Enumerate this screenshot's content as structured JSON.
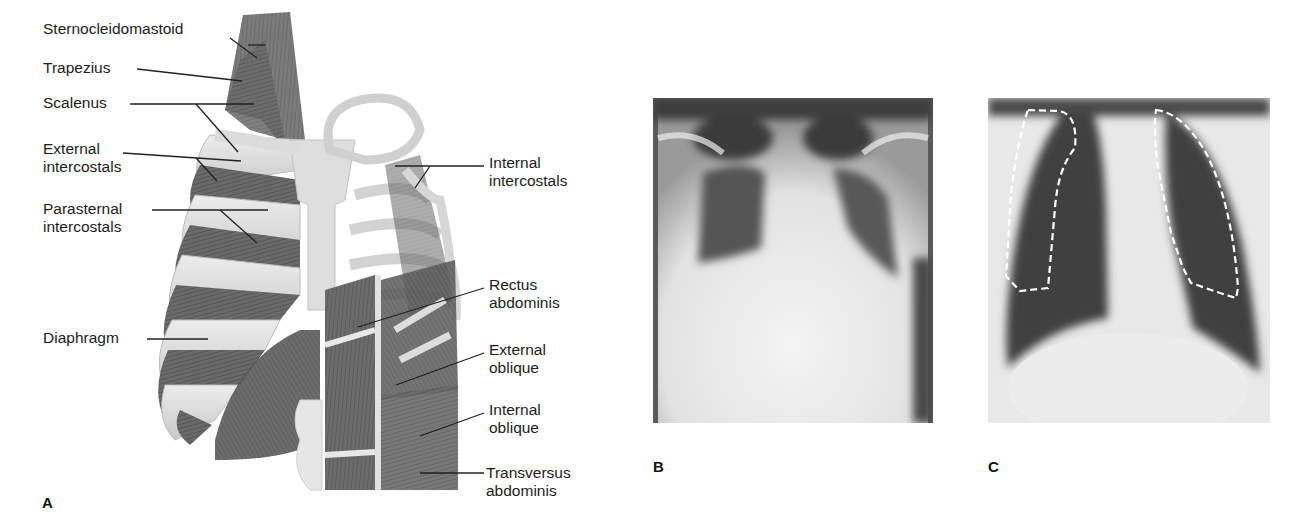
{
  "figure": {
    "panel_a": {
      "letter": "A",
      "subject": "respiratory-muscles-illustration",
      "labels_left": [
        {
          "id": "sternocleidomastoid",
          "lines": [
            "Sternocleidomastoid"
          ]
        },
        {
          "id": "trapezius",
          "lines": [
            "Trapezius"
          ]
        },
        {
          "id": "scalenus",
          "lines": [
            "Scalenus"
          ]
        },
        {
          "id": "external-intercostals",
          "lines": [
            "External",
            "intercostals"
          ]
        },
        {
          "id": "parasternal-intercostals",
          "lines": [
            "Parasternal",
            "intercostals"
          ]
        },
        {
          "id": "diaphragm",
          "lines": [
            "Diaphragm"
          ]
        }
      ],
      "labels_right": [
        {
          "id": "internal-intercostals",
          "lines": [
            "Internal",
            "intercostals"
          ]
        },
        {
          "id": "rectus-abdominis",
          "lines": [
            "Rectus",
            "abdominis"
          ]
        },
        {
          "id": "external-oblique",
          "lines": [
            "External",
            "oblique"
          ]
        },
        {
          "id": "internal-oblique",
          "lines": [
            "Internal",
            "oblique"
          ]
        },
        {
          "id": "transversus-abdominis",
          "lines": [
            "Transversus",
            "abdominis"
          ]
        }
      ]
    },
    "panel_b": {
      "letter": "B",
      "subject": "chest-xray-hyperinflated-poor-effort"
    },
    "panel_c": {
      "letter": "C",
      "subject": "chest-xray-with-dashed-lung-outline",
      "overlay": "dashed-white-outline"
    }
  },
  "colors": {
    "background": "#ffffff",
    "text": "#1c1c1c",
    "leader_line": "#222222",
    "muscle": "#6e6e6e",
    "bone": "#d9d9d9",
    "xray_dark": "#3a3a3a",
    "xray_light": "#efefef",
    "dash_outline": "#ffffff"
  }
}
